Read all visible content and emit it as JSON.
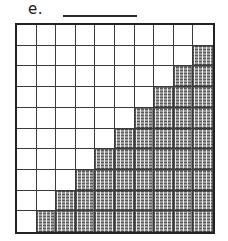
{
  "problem": {
    "label": "e.",
    "answer_blank": ""
  },
  "grid": {
    "columns": 10,
    "rows": 10,
    "total_cells": 100,
    "shaded_cells": 45,
    "unshaded_cells": 55,
    "shading_color": "#9a9a9a",
    "border_color": "#222222",
    "gridline_color": "#3a3a3a",
    "background_color": "#ffffff",
    "shaded_per_row": [
      0,
      1,
      2,
      3,
      4,
      5,
      6,
      7,
      8,
      9
    ],
    "shaded_alignment": "right",
    "pattern": "staircase",
    "rows_data": [
      {
        "row": 1,
        "shaded": 0,
        "cells": [
          0,
          0,
          0,
          0,
          0,
          0,
          0,
          0,
          0,
          0
        ]
      },
      {
        "row": 2,
        "shaded": 1,
        "cells": [
          0,
          0,
          0,
          0,
          0,
          0,
          0,
          0,
          0,
          1
        ]
      },
      {
        "row": 3,
        "shaded": 2,
        "cells": [
          0,
          0,
          0,
          0,
          0,
          0,
          0,
          0,
          1,
          1
        ]
      },
      {
        "row": 4,
        "shaded": 3,
        "cells": [
          0,
          0,
          0,
          0,
          0,
          0,
          0,
          1,
          1,
          1
        ]
      },
      {
        "row": 5,
        "shaded": 4,
        "cells": [
          0,
          0,
          0,
          0,
          0,
          0,
          1,
          1,
          1,
          1
        ]
      },
      {
        "row": 6,
        "shaded": 5,
        "cells": [
          0,
          0,
          0,
          0,
          0,
          1,
          1,
          1,
          1,
          1
        ]
      },
      {
        "row": 7,
        "shaded": 6,
        "cells": [
          0,
          0,
          0,
          0,
          1,
          1,
          1,
          1,
          1,
          1
        ]
      },
      {
        "row": 8,
        "shaded": 7,
        "cells": [
          0,
          0,
          0,
          1,
          1,
          1,
          1,
          1,
          1,
          1
        ]
      },
      {
        "row": 9,
        "shaded": 8,
        "cells": [
          0,
          0,
          1,
          1,
          1,
          1,
          1,
          1,
          1,
          1
        ]
      },
      {
        "row": 10,
        "shaded": 9,
        "cells": [
          0,
          1,
          1,
          1,
          1,
          1,
          1,
          1,
          1,
          1
        ]
      }
    ]
  }
}
